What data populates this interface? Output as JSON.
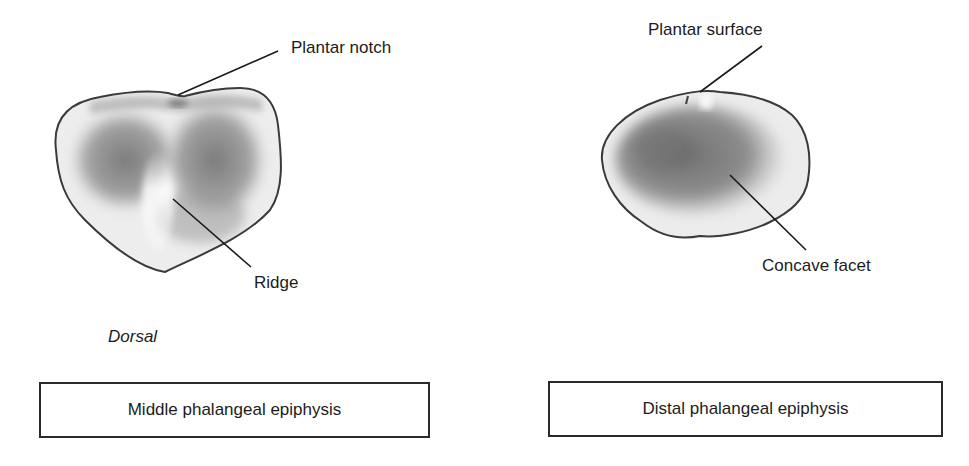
{
  "figure": {
    "left_panel": {
      "title": "Middle phalangeal epiphysis",
      "view_label": "Dorsal",
      "callouts": [
        {
          "id": "plantar-notch",
          "label": "Plantar notch"
        },
        {
          "id": "ridge",
          "label": "Ridge"
        }
      ]
    },
    "right_panel": {
      "title": "Distal phalangeal epiphysis",
      "callouts": [
        {
          "id": "plantar-surface",
          "label": "Plantar surface"
        },
        {
          "id": "concave-facet",
          "label": "Concave facet"
        }
      ]
    },
    "colors": {
      "background": "#ffffff",
      "ink": "#1c1c1c",
      "bone_light": "#f2f2f2",
      "bone_mid": "#b8b8b8",
      "bone_dark": "#6e6e6e",
      "outline": "#3a3a3a"
    }
  }
}
